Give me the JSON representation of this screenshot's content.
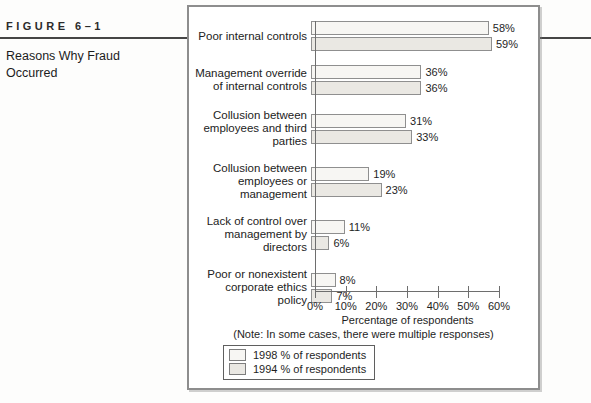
{
  "figure": {
    "label": "FIGURE 6–1",
    "title": "Reasons Why Fraud\nOccurred"
  },
  "chart_data": {
    "type": "bar",
    "orientation": "horizontal",
    "categories": [
      "Poor internal controls",
      "Management override of internal controls",
      "Collusion between employees and third parties",
      "Collusion between employees or management",
      "Lack of control over management by directors",
      "Poor or nonexistent corporate ethics policy"
    ],
    "categories_wrapped": [
      "Poor internal controls",
      "Management override\nof internal controls",
      "Collusion between\nemployees and third\nparties",
      "Collusion between\nemployees or\nmanagement",
      "Lack of control over\nmanagement by\ndirectors",
      "Poor or nonexistent\ncorporate ethics\npolicy"
    ],
    "series": [
      {
        "name": "1998 % of respondents",
        "values": [
          58,
          36,
          31,
          19,
          11,
          8
        ],
        "fill": "#f7f6f3"
      },
      {
        "name": "1994 % of respondents",
        "values": [
          59,
          36,
          33,
          23,
          6,
          7
        ],
        "fill": "#eae8e3"
      }
    ],
    "value_suffix": "%",
    "x_ticks": [
      "0%",
      "10%",
      "20%",
      "30%",
      "40%",
      "50%",
      "60%"
    ],
    "xlim": [
      0,
      60
    ],
    "xlabel": "Percentage of respondents",
    "note": "(Note: In some cases, there were multiple responses)",
    "legend_position": "bottom-left",
    "grid": false,
    "bar_border_color": "#8f8f8f",
    "axis_color": "#6e6e6e"
  }
}
